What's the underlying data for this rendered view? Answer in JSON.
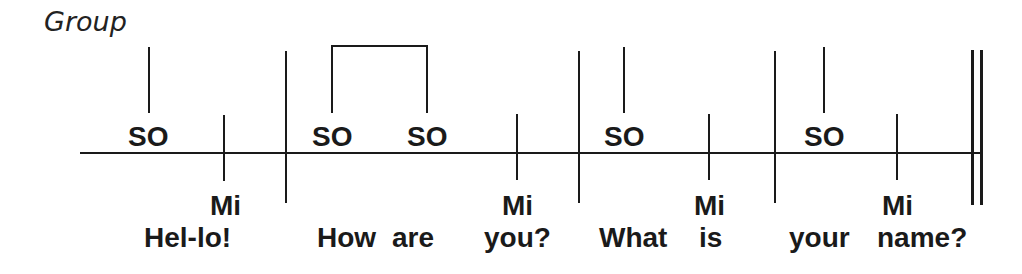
{
  "title": "Group",
  "colors": {
    "ink": "#1a1a1a",
    "background": "#ffffff"
  },
  "staff": {
    "line_y": 153,
    "x_start": 80,
    "x_end": 982
  },
  "bar_lines": [
    {
      "x": 286,
      "type": "single"
    },
    {
      "x": 579,
      "type": "single"
    },
    {
      "x": 775,
      "type": "single"
    },
    {
      "x": 972,
      "type": "double"
    }
  ],
  "measures": [
    {
      "notes": [
        {
          "syllable": "SO",
          "pitch": "high",
          "x": 149
        },
        {
          "syllable": "Mi",
          "pitch": "low",
          "x": 224
        }
      ],
      "lyrics": [
        "Hel-lo!"
      ]
    },
    {
      "notes": [
        {
          "syllable": "SO",
          "pitch": "high",
          "x": 332,
          "beamed": true
        },
        {
          "syllable": "SO",
          "pitch": "high",
          "x": 427,
          "beamed": true
        },
        {
          "syllable": "Mi",
          "pitch": "low",
          "x": 517
        }
      ],
      "lyrics": [
        "How",
        "are",
        "you?"
      ]
    },
    {
      "notes": [
        {
          "syllable": "SO",
          "pitch": "high",
          "x": 624
        },
        {
          "syllable": "Mi",
          "pitch": "low",
          "x": 709
        }
      ],
      "lyrics": [
        "What",
        "is"
      ]
    },
    {
      "notes": [
        {
          "syllable": "SO",
          "pitch": "high",
          "x": 824
        },
        {
          "syllable": "Mi",
          "pitch": "low",
          "x": 897
        }
      ],
      "lyrics": [
        "your",
        "name?"
      ]
    }
  ],
  "labels": {
    "so_1": "SO",
    "mi_1": "Mi",
    "so_2": "SO",
    "so_3": "SO",
    "mi_2": "Mi",
    "so_4": "SO",
    "mi_3": "Mi",
    "so_5": "SO",
    "mi_4": "Mi"
  },
  "lyrics": {
    "hello": "Hel-lo!",
    "how": "How",
    "are": "are",
    "you": "you?",
    "what": "What",
    "is": "is",
    "your": "your",
    "name": "name?"
  }
}
